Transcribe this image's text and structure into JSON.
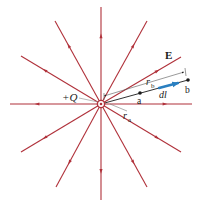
{
  "diagram": {
    "charge_label": "+Q",
    "field_label": "E",
    "point_a_label": "a",
    "point_b_label": "b",
    "ra_label": "r",
    "ra_sub": "a",
    "rb_label": "r",
    "rb_sub": "b",
    "dl_label": "dl"
  },
  "colors": {
    "field_line": "#b0313a",
    "path": "#1a1a1a",
    "dl_vector": "#2a7fc0",
    "text": "#1a1a1a"
  },
  "center": [
    101,
    104
  ],
  "field_lines": [
    {
      "end": [
        101,
        7
      ]
    },
    {
      "end": [
        147,
        21
      ]
    },
    {
      "end": [
        181,
        57
      ]
    },
    {
      "end": [
        192,
        104
      ]
    },
    {
      "end": [
        181,
        152
      ]
    },
    {
      "end": [
        147,
        187
      ]
    },
    {
      "end": [
        101,
        200
      ]
    },
    {
      "end": [
        56,
        187
      ]
    },
    {
      "end": [
        21,
        152
      ]
    },
    {
      "end": [
        10,
        104
      ]
    },
    {
      "end": [
        21,
        56
      ]
    },
    {
      "end": [
        55,
        21
      ]
    }
  ]
}
